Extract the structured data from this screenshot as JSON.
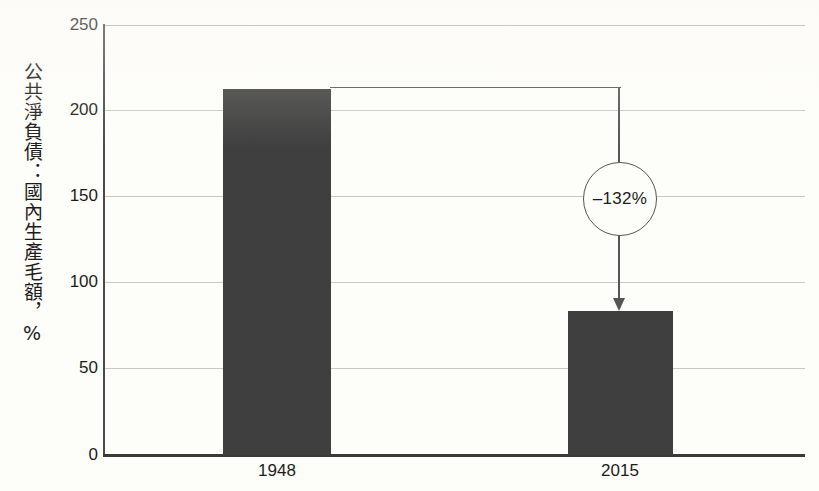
{
  "chart_data": {
    "type": "bar",
    "title": "",
    "subtitle": "",
    "xlabel": "",
    "ylabel": "公共淨負債：國內生產毛額，%",
    "categories": [
      "1948",
      "2015"
    ],
    "values": [
      213,
      84
    ],
    "ylim": [
      0,
      250
    ],
    "yticks": [
      0,
      50,
      100,
      150,
      200,
      250
    ],
    "ytick_labels": [
      "0",
      "50",
      "100",
      "150",
      "200",
      "250"
    ],
    "grid": true,
    "legend": "none",
    "bar_color": "#3f3f3f",
    "annotations": [
      {
        "text": "–132%",
        "type": "change-callout",
        "from_category": "1948",
        "to_category": "2015"
      }
    ]
  },
  "axes": {
    "y": {
      "ticks": [
        {
          "label": "250",
          "value": 250
        },
        {
          "label": "200",
          "value": 200
        },
        {
          "label": "150",
          "value": 150
        },
        {
          "label": "100",
          "value": 100
        },
        {
          "label": "50",
          "value": 50
        },
        {
          "label": "0",
          "value": 0
        }
      ],
      "title": "公共淨負債：國內生產毛額，%"
    },
    "x": {
      "ticks": [
        {
          "label": "1948"
        },
        {
          "label": "2015"
        }
      ]
    }
  },
  "bars": [
    {
      "category": "1948",
      "value": 213
    },
    {
      "category": "2015",
      "value": 84
    }
  ],
  "callout": {
    "label": "–132%"
  },
  "colors": {
    "bar": "#3f3f3f",
    "axis": "#3a3a3a",
    "grid": "#c8c8c4",
    "annotation": "#555555",
    "background": "#fdfdfa",
    "text": "#1c1c1c"
  }
}
